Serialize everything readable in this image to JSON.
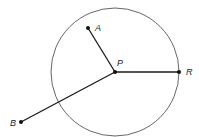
{
  "diagram": {
    "circle": {
      "cx": 115,
      "cy": 72,
      "r": 64,
      "stroke": "#555555"
    },
    "center": {
      "name": "P",
      "x": 115,
      "y": 72
    },
    "points": [
      {
        "name": "A",
        "x": 88,
        "y": 28,
        "label_dx": 7,
        "label_dy": 3
      },
      {
        "name": "R",
        "x": 179,
        "y": 72,
        "label_dx": 8,
        "label_dy": 3
      },
      {
        "name": "B",
        "x": 21,
        "y": 122,
        "label_dx": -11,
        "label_dy": 3
      }
    ],
    "center_label": {
      "text": "P",
      "dx": 2,
      "dy": -6
    },
    "line_color": "#1a1a1a"
  }
}
